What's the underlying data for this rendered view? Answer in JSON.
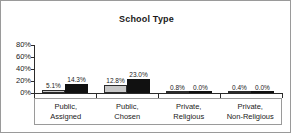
{
  "chart_data": {
    "type": "bar",
    "title": "School Type",
    "xlabel": "",
    "ylabel": "",
    "ylim": [
      0,
      80
    ],
    "grid": false,
    "legend_position": "none",
    "categories": [
      "Public,\nAssigned",
      "Public,\nChosen",
      "Private,\nReligious",
      "Private,\nNon-Religious"
    ],
    "category_lines": [
      [
        "Public,",
        "Assigned"
      ],
      [
        "Public,",
        "Chosen"
      ],
      [
        "Private,",
        "Religious"
      ],
      [
        "Private,",
        "Non-Religious"
      ]
    ],
    "ytick_labels": [
      "80%",
      "60%",
      "40%",
      "20%",
      "0%"
    ],
    "ytick_values": [
      80,
      60,
      40,
      20,
      0
    ],
    "series": [
      {
        "name": "series-1",
        "color": "#c7c7c7",
        "values": [
          5.1,
          12.8,
          0.8,
          0.4
        ],
        "labels": [
          "5.1%",
          "12.8%",
          "0.8%",
          "0.4%"
        ]
      },
      {
        "name": "series-2",
        "color": "#111111",
        "values": [
          14.3,
          23.0,
          0.0,
          0.0
        ],
        "labels": [
          "14.3%",
          "23.0%",
          "0.0%",
          "0.0%"
        ]
      }
    ]
  },
  "frame": {
    "border_color": "#9a9a9a",
    "background": "#ffffff",
    "axis_color": "#2b2b2b"
  }
}
